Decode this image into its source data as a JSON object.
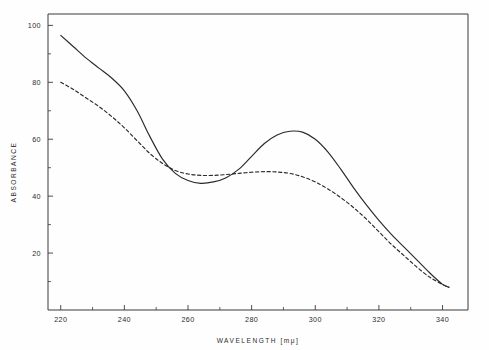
{
  "chart_data": {
    "type": "line",
    "title": "",
    "xlabel": "WAVELENGTH  [mμ]",
    "ylabel": "ABSORBANCE",
    "xlim": [
      216,
      348
    ],
    "ylim": [
      0,
      104
    ],
    "grid": false,
    "legend": "none",
    "xticks": [
      220,
      240,
      260,
      280,
      300,
      320,
      340
    ],
    "xtick_labels": [
      "220",
      "240",
      "260",
      "280",
      "300",
      "320",
      "340"
    ],
    "xminor_ticks": [
      230,
      250,
      270,
      290,
      310,
      330
    ],
    "yticks": [
      20,
      40,
      60,
      80,
      100
    ],
    "ytick_labels": [
      "20",
      "40",
      "60",
      "80",
      "100"
    ],
    "yminor_ticks": [
      10,
      30,
      50,
      70,
      90
    ],
    "series": [
      {
        "name": "solid-curve",
        "style": "solid",
        "color": "#2a2a2a",
        "x": [
          220,
          224,
          228,
          232,
          236,
          240,
          244,
          248,
          252,
          256,
          260,
          264,
          268,
          272,
          276,
          280,
          284,
          288,
          292,
          296,
          300,
          304,
          308,
          312,
          316,
          320,
          324,
          328,
          332,
          336,
          340,
          342
        ],
        "y": [
          96.5,
          92.5,
          88.5,
          85.0,
          81.5,
          77.0,
          70.0,
          61.0,
          53.0,
          48.0,
          45.5,
          44.5,
          45.0,
          46.5,
          49.5,
          54.0,
          58.5,
          61.5,
          62.8,
          62.5,
          60.0,
          55.5,
          49.5,
          43.0,
          37.0,
          31.5,
          26.5,
          22.0,
          17.5,
          13.0,
          9.0,
          8.0
        ]
      },
      {
        "name": "dashed-curve",
        "style": "dashed",
        "color": "#2a2a2a",
        "x": [
          220,
          224,
          228,
          232,
          236,
          240,
          244,
          248,
          252,
          256,
          260,
          264,
          268,
          272,
          276,
          280,
          284,
          288,
          292,
          296,
          300,
          304,
          308,
          312,
          316,
          320,
          324,
          328,
          332,
          336,
          340,
          342
        ],
        "y": [
          80.0,
          77.5,
          74.5,
          71.5,
          68.0,
          64.0,
          59.5,
          55.0,
          51.5,
          49.0,
          47.8,
          47.3,
          47.3,
          47.6,
          48.0,
          48.4,
          48.6,
          48.5,
          48.0,
          46.8,
          45.0,
          42.5,
          39.5,
          36.0,
          32.0,
          27.5,
          23.0,
          19.0,
          15.0,
          11.5,
          9.0,
          8.0
        ]
      }
    ],
    "annotations": []
  },
  "axis": {
    "y_title": "ABSORBANCE",
    "x_title": "WAVELENGTH  [mμ]"
  }
}
